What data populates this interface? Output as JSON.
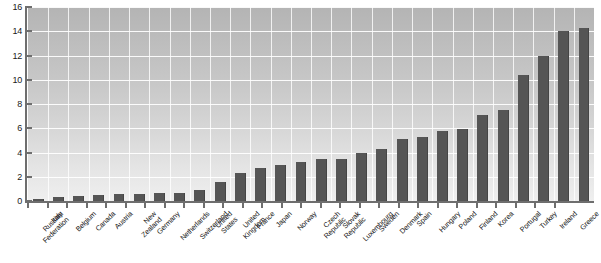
{
  "chart_data": {
    "type": "bar",
    "title": "",
    "subtitle": "",
    "xlabel": "",
    "ylabel": "",
    "ylim": [
      0,
      16
    ],
    "ytick_step": 2,
    "ytick_labels": [
      "16",
      "14",
      "12",
      "10",
      "8",
      "6",
      "4",
      "2",
      "0"
    ],
    "ytick_values": [
      16,
      14,
      12,
      10,
      8,
      6,
      4,
      2,
      0
    ],
    "grid": true,
    "grid_horizontal": true,
    "grid_vertical": true,
    "legend": false,
    "legend_position": "none",
    "bar_color": "#555555",
    "plot_background_top": "#b4b4b4",
    "plot_background_bottom": "#efefef",
    "gridline_color": "#ffffff",
    "axis_color": "#6e6e6e",
    "categories": [
      "Russian Federation",
      "Italy",
      "Belgium",
      "Canada",
      "Austria",
      "New Zealand",
      "Germany",
      "Netherlands",
      "Switzerland",
      "United States",
      "United Kingdom",
      "France",
      "Japan",
      "Norway",
      "Czech Republic",
      "Slovak Republic",
      "Luxembourg",
      "Sweden",
      "Denmark",
      "Spain",
      "Hungary",
      "Poland",
      "Finland",
      "Korea",
      "Portugal",
      "Turkey",
      "Ireland",
      "Greece"
    ],
    "values": [
      0.15,
      0.3,
      0.4,
      0.5,
      0.55,
      0.6,
      0.65,
      0.7,
      0.9,
      1.6,
      2.3,
      2.7,
      3.0,
      3.2,
      3.5,
      3.5,
      4.0,
      4.3,
      5.1,
      5.3,
      5.8,
      5.9,
      7.1,
      7.5,
      10.4,
      12.0,
      14.0,
      14.3
    ]
  }
}
